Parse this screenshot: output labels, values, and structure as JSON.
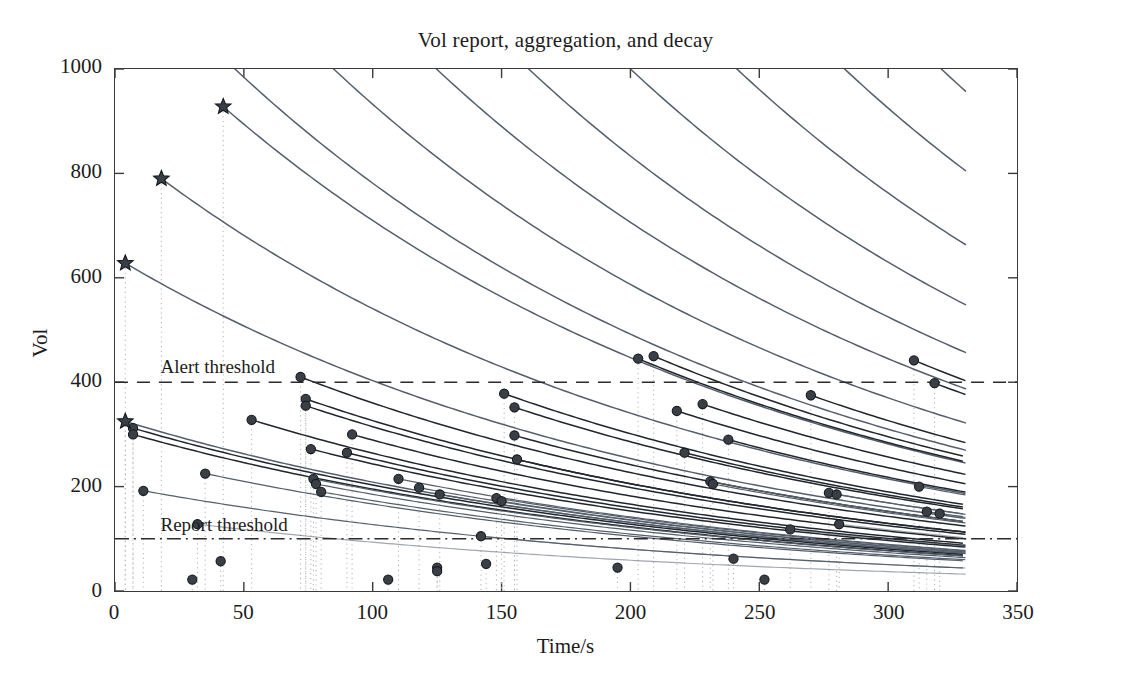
{
  "chart_data": {
    "type": "line",
    "title": "Vol report, aggregation, and decay",
    "xlabel": "Time/s",
    "ylabel": "Vol",
    "xlim": [
      0,
      350
    ],
    "ylim": [
      0,
      1000
    ],
    "xticks": [
      0,
      50,
      100,
      150,
      200,
      250,
      300,
      350
    ],
    "yticks": [
      0,
      200,
      400,
      600,
      800,
      1000
    ],
    "grid": "vertical dotted event lines only",
    "legend": "none",
    "annotations": [
      {
        "name": "alert-threshold",
        "text": "Alert threshold",
        "y": 400,
        "style": "dashed",
        "x_text": 18
      },
      {
        "name": "report-threshold",
        "text": "Report threshold",
        "y": 100,
        "style": "dash-dot",
        "x_text": 18
      }
    ],
    "decay_model": "exponential decay toward report threshold; each marker starts a decaying curve",
    "decay_half_life": 150,
    "star_events": [
      {
        "t": 4,
        "vol": 325
      },
      {
        "t": 18,
        "vol": 790
      },
      {
        "t": 42,
        "vol": 928
      },
      {
        "t": 4,
        "vol": 628
      }
    ],
    "point_events": [
      {
        "t": 7,
        "vol": 312
      },
      {
        "t": 7,
        "vol": 300
      },
      {
        "t": 11,
        "vol": 192
      },
      {
        "t": 30,
        "vol": 22
      },
      {
        "t": 32,
        "vol": 128
      },
      {
        "t": 35,
        "vol": 225
      },
      {
        "t": 41,
        "vol": 57
      },
      {
        "t": 53,
        "vol": 328
      },
      {
        "t": 72,
        "vol": 410
      },
      {
        "t": 74,
        "vol": 368
      },
      {
        "t": 74,
        "vol": 355
      },
      {
        "t": 76,
        "vol": 272
      },
      {
        "t": 77,
        "vol": 215
      },
      {
        "t": 78,
        "vol": 205
      },
      {
        "t": 80,
        "vol": 190
      },
      {
        "t": 90,
        "vol": 265
      },
      {
        "t": 92,
        "vol": 300
      },
      {
        "t": 106,
        "vol": 22
      },
      {
        "t": 110,
        "vol": 215
      },
      {
        "t": 118,
        "vol": 198
      },
      {
        "t": 125,
        "vol": 45
      },
      {
        "t": 125,
        "vol": 38
      },
      {
        "t": 126,
        "vol": 185
      },
      {
        "t": 142,
        "vol": 105
      },
      {
        "t": 144,
        "vol": 52
      },
      {
        "t": 148,
        "vol": 178
      },
      {
        "t": 150,
        "vol": 172
      },
      {
        "t": 151,
        "vol": 378
      },
      {
        "t": 155,
        "vol": 352
      },
      {
        "t": 155,
        "vol": 298
      },
      {
        "t": 156,
        "vol": 252
      },
      {
        "t": 195,
        "vol": 45
      },
      {
        "t": 203,
        "vol": 445
      },
      {
        "t": 209,
        "vol": 450
      },
      {
        "t": 218,
        "vol": 345
      },
      {
        "t": 221,
        "vol": 265
      },
      {
        "t": 228,
        "vol": 358
      },
      {
        "t": 231,
        "vol": 210
      },
      {
        "t": 232,
        "vol": 205
      },
      {
        "t": 238,
        "vol": 290
      },
      {
        "t": 240,
        "vol": 62
      },
      {
        "t": 252,
        "vol": 22
      },
      {
        "t": 262,
        "vol": 118
      },
      {
        "t": 270,
        "vol": 375
      },
      {
        "t": 277,
        "vol": 188
      },
      {
        "t": 280,
        "vol": 185
      },
      {
        "t": 281,
        "vol": 128
      },
      {
        "t": 310,
        "vol": 442
      },
      {
        "t": 312,
        "vol": 200
      },
      {
        "t": 315,
        "vol": 152
      },
      {
        "t": 318,
        "vol": 398
      },
      {
        "t": 320,
        "vol": 148
      }
    ],
    "high_curve_entries": [
      {
        "t0": 0,
        "vol0": 1240
      },
      {
        "t0": 0,
        "vol0": 1480
      },
      {
        "t0": 0,
        "vol0": 1780
      },
      {
        "t0": 0,
        "vol0": 2100
      },
      {
        "t0": 0,
        "vol0": 2520
      },
      {
        "t0": 0,
        "vol0": 3050
      },
      {
        "t0": 0,
        "vol0": 3700
      },
      {
        "t0": 0,
        "vol0": 4400
      },
      {
        "t0": 0,
        "vol0": 5300
      },
      {
        "t0": 0,
        "vol0": 6400
      }
    ]
  },
  "axes": {
    "y_tick_labels": [
      "1000",
      "800",
      "600",
      "400",
      "200",
      "0"
    ],
    "x_tick_labels": [
      "0",
      "50",
      "100",
      "150",
      "200",
      "250",
      "300",
      "350"
    ]
  },
  "colors": {
    "curve": "#555f6b",
    "curve_dark": "#20262e",
    "marker": "#3a3f46",
    "axis": "#3a3a3a",
    "grid_dotted": "#b9b9b9",
    "threshold": "#2b2b2b",
    "background": "#ffffff"
  }
}
